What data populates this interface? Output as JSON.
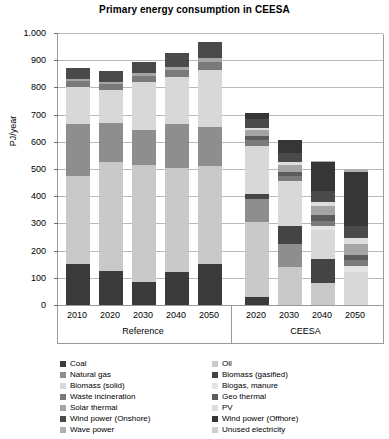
{
  "chart_data": {
    "type": "bar",
    "variant": "stacked",
    "title": "Primary energy consumption in CEESA",
    "xlabel": "",
    "ylabel": "PJ/year",
    "ylim": [
      0,
      1000
    ],
    "ytick_values": [
      0,
      100,
      200,
      300,
      400,
      500,
      600,
      700,
      800,
      900,
      1000
    ],
    "ytick_labels": [
      "0",
      "100",
      "200",
      "300",
      "400",
      "500",
      "600",
      "700",
      "800",
      "900",
      "1.000"
    ],
    "grid": true,
    "legend_position": "bottom",
    "groups": [
      {
        "name": "Reference",
        "categories": [
          "2010",
          "2020",
          "2030",
          "2040",
          "2050"
        ]
      },
      {
        "name": "CEESA",
        "categories": [
          "2020",
          "2030",
          "2040",
          "2050"
        ]
      }
    ],
    "categories": [
      "2010",
      "2020",
      "2030",
      "2040",
      "2050",
      "2020",
      "2030",
      "2040",
      "2050"
    ],
    "series": [
      {
        "name": "Coal",
        "color": "#3b3b3b",
        "values": [
          150,
          125,
          85,
          120,
          150,
          30,
          0,
          0,
          0
        ]
      },
      {
        "name": "Oil",
        "color": "#c9c9c9",
        "values": [
          325,
          400,
          430,
          385,
          360,
          275,
          140,
          80,
          0
        ]
      },
      {
        "name": "Natural gas",
        "color": "#8e8e8e",
        "values": [
          190,
          145,
          130,
          160,
          145,
          85,
          85,
          0,
          0
        ]
      },
      {
        "name": "Biomass (gasified)",
        "color": "#444444",
        "values": [
          0,
          0,
          0,
          0,
          0,
          20,
          65,
          90,
          0
        ]
      },
      {
        "name": "Biomass (solid)",
        "color": "#d8d8d8",
        "values": [
          135,
          120,
          175,
          175,
          210,
          175,
          165,
          105,
          120
        ]
      },
      {
        "name": "Biogas, manure",
        "color": "#e4e4e4",
        "values": [
          0,
          0,
          0,
          0,
          0,
          0,
          0,
          15,
          25
        ]
      },
      {
        "name": "Waste incineration",
        "color": "#7a7a7a",
        "values": [
          25,
          22,
          23,
          25,
          28,
          20,
          20,
          20,
          20
        ]
      },
      {
        "name": "Geo thermal",
        "color": "#5c5c5c",
        "values": [
          0,
          0,
          0,
          0,
          0,
          15,
          15,
          20,
          20
        ]
      },
      {
        "name": "Solar thermal",
        "color": "#a5a5a5",
        "values": [
          5,
          8,
          10,
          12,
          15,
          25,
          25,
          35,
          40
        ]
      },
      {
        "name": "PV",
        "color": "#dedede",
        "values": [
          0,
          0,
          0,
          0,
          0,
          5,
          10,
          15,
          20
        ]
      },
      {
        "name": "Wind power (Onshore)",
        "color": "#4a4a4a",
        "values": [
          40,
          40,
          42,
          50,
          60,
          35,
          35,
          40,
          45
        ]
      },
      {
        "name": "Wind power (Offhore)",
        "color": "#363636",
        "values": [
          0,
          0,
          0,
          0,
          0,
          20,
          45,
          105,
          200
        ]
      },
      {
        "name": "Wave power",
        "color": "#b0b0b0",
        "values": [
          0,
          0,
          0,
          0,
          0,
          0,
          0,
          5,
          10
        ]
      },
      {
        "name": "Unused electricity",
        "color": "#cfcfcf",
        "values": [
          0,
          0,
          0,
          0,
          0,
          0,
          0,
          0,
          0
        ]
      }
    ],
    "totals": [
      870,
      860,
      895,
      927,
      968,
      680,
      570,
      530,
      480
    ]
  },
  "legend": {
    "left_column": [
      {
        "label": "Coal",
        "color": "#3b3b3b"
      },
      {
        "label": "Natural gas",
        "color": "#8e8e8e"
      },
      {
        "label": "Biomass (solid)",
        "color": "#d8d8d8"
      },
      {
        "label": "Waste incineration",
        "color": "#7a7a7a"
      },
      {
        "label": "Solar thermal",
        "color": "#a5a5a5"
      },
      {
        "label": "Wind power (Onshore)",
        "color": "#4a4a4a"
      },
      {
        "label": "Wave power",
        "color": "#b0b0b0"
      }
    ],
    "right_column": [
      {
        "label": "Oil",
        "color": "#c9c9c9"
      },
      {
        "label": "Biomass (gasified)",
        "color": "#444444"
      },
      {
        "label": "Biogas, manure",
        "color": "#e4e4e4"
      },
      {
        "label": "Geo thermal",
        "color": "#5c5c5c"
      },
      {
        "label": "PV",
        "color": "#dedede"
      },
      {
        "label": "Wind power (Offhore)",
        "color": "#363636"
      },
      {
        "label": "Unused electricity",
        "color": "#cfcfcf"
      }
    ]
  }
}
